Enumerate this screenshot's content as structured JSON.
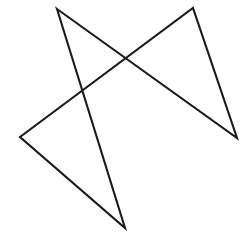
{
  "figure": {
    "background_color": "#ffffff",
    "stroke_color": "#1a1a1a",
    "stroke_width": 2.1,
    "canvas": {
      "width": 242,
      "height": 232
    },
    "orientation": "point-down",
    "closed_path": true,
    "vertex_count": 5,
    "vertices": [
      {
        "name": "upper-left-point",
        "x": 57,
        "y": 9
      },
      {
        "name": "right-point",
        "x": 237,
        "y": 138
      },
      {
        "name": "upper-right-point",
        "x": 193,
        "y": 8
      },
      {
        "name": "left-point",
        "x": 20,
        "y": 137
      },
      {
        "name": "bottom-point",
        "x": 125,
        "y": 228
      }
    ],
    "path_d": "M 57 9 L 237 138 L 193 8 L 20 137 L 125 228 Z",
    "intersections": [
      {
        "name": "upper-crossing",
        "x": 128,
        "y": 60
      },
      {
        "name": "left-crossing",
        "x": 88,
        "y": 94
      },
      {
        "name": "right-crossing",
        "x": 165,
        "y": 92
      },
      {
        "name": "lower-left-crossing",
        "x": 100,
        "y": 137
      },
      {
        "name": "lower-right-crossing",
        "x": 153,
        "y": 138
      }
    ]
  }
}
